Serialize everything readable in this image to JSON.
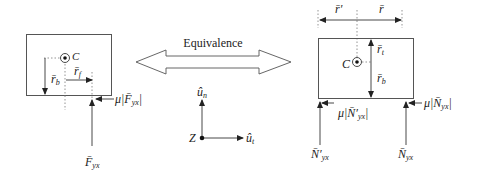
{
  "figure": {
    "center_label": "Equivalence",
    "left_panel": {
      "center_point": "C",
      "labels": {
        "r_b": "r̄",
        "r_b_sub": "b",
        "r_f": "r̄",
        "r_f_sub": "f",
        "friction": "μ|",
        "friction_F": "F̄",
        "friction_sub": "yx",
        "friction_end": "|",
        "force": "F̄",
        "force_sub": "yx"
      }
    },
    "axes": {
      "origin": "Z",
      "u_n": "û",
      "u_n_sub": "n",
      "u_t": "û",
      "u_t_sub": "t"
    },
    "right_panel": {
      "center_point": "C",
      "labels": {
        "r_prime": "r̄′",
        "r": "r̄",
        "r_t": "r̄",
        "r_t_sub": "t",
        "r_b": "r̄",
        "r_b_sub": "b",
        "friction_left": "μ|",
        "friction_left_N": "N̄′",
        "friction_left_sub": "yx",
        "friction_left_end": "|",
        "friction_right": "μ|",
        "friction_right_N": "N̄",
        "friction_right_sub": "yx",
        "friction_right_end": "|",
        "normal_left": "N̄′",
        "normal_left_sub": "yx",
        "normal_right": "N̄",
        "normal_right_sub": "yx"
      }
    }
  }
}
